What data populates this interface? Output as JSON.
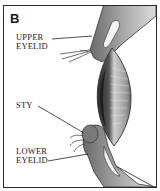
{
  "figure": {
    "panel_letter": "B",
    "labels": {
      "upper_eyelid_line1": "UPPER",
      "upper_eyelid_line2": "EYELID",
      "sty": "STY",
      "lower_eyelid_line1": "LOWER",
      "lower_eyelid_line2": "EYELID"
    },
    "colors": {
      "border": "#2a2a2a",
      "ink": "#222222",
      "shade_dark": "#3a3a3a",
      "shade_mid": "#8a8a8a",
      "shade_light": "#cfcfcf"
    }
  }
}
